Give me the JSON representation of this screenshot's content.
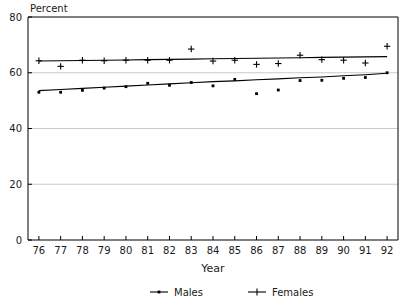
{
  "chart_data": {
    "type": "line",
    "title": "",
    "unit_label": "Percent",
    "xlabel": "Year",
    "ylabel": "",
    "categories": [
      "76",
      "77",
      "78",
      "79",
      "80",
      "81",
      "82",
      "83",
      "84",
      "85",
      "86",
      "87",
      "88",
      "89",
      "90",
      "91",
      "92"
    ],
    "x": [
      76,
      77,
      78,
      79,
      80,
      81,
      82,
      83,
      84,
      85,
      86,
      87,
      88,
      89,
      90,
      91,
      92
    ],
    "ylim": [
      0,
      80
    ],
    "xlim": [
      75.5,
      92.5
    ],
    "yticks": [
      "0",
      "20",
      "40",
      "60",
      "80"
    ],
    "ytick_values": [
      0,
      20,
      40,
      60,
      80
    ],
    "grid": true,
    "grid_axis": "y",
    "legend_position": "bottom",
    "series": [
      {
        "name": "Males",
        "marker": "dot",
        "color": "#000000",
        "values": [
          53.0,
          53.0,
          53.7,
          54.5,
          55.0,
          56.2,
          55.5,
          56.5,
          55.3,
          57.6,
          52.5,
          53.8,
          57.2,
          57.3,
          58.0,
          58.3,
          60.0
        ],
        "trend": [
          53.6,
          54.0,
          54.4,
          54.8,
          55.2,
          55.6,
          56.0,
          56.4,
          56.8,
          57.1,
          57.5,
          57.8,
          58.2,
          58.5,
          58.9,
          59.3,
          59.8
        ]
      },
      {
        "name": "Females",
        "marker": "plus",
        "color": "#000000",
        "values": [
          64.3,
          62.3,
          64.5,
          64.3,
          64.5,
          64.5,
          64.5,
          68.5,
          64.2,
          64.5,
          63.0,
          63.3,
          66.3,
          64.7,
          64.5,
          63.5,
          69.5
        ],
        "trend": [
          64.2,
          64.3,
          64.4,
          64.5,
          64.6,
          64.7,
          64.8,
          64.9,
          65.0,
          65.1,
          65.2,
          65.3,
          65.4,
          65.5,
          65.6,
          65.7,
          65.8
        ]
      }
    ],
    "legend": [
      {
        "label": "Males",
        "marker": "dot"
      },
      {
        "label": "Females",
        "marker": "plus"
      }
    ]
  }
}
